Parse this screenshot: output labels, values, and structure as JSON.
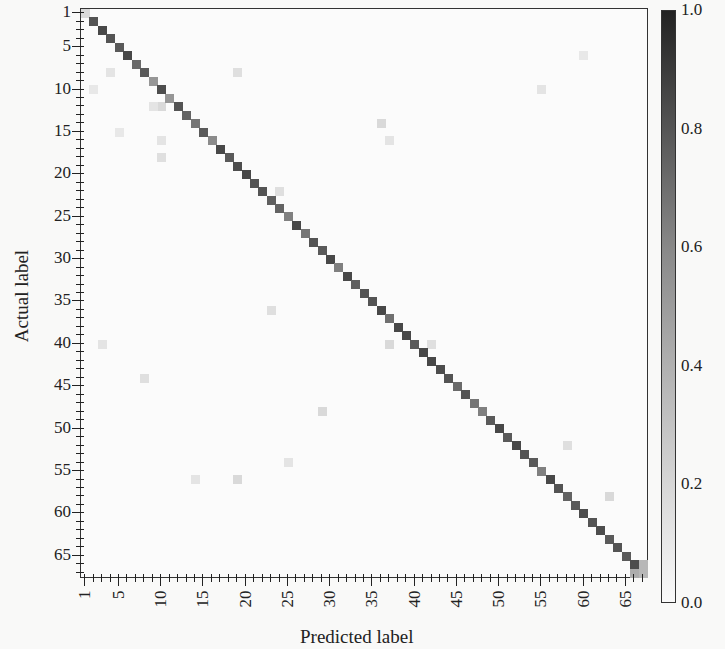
{
  "chart_data": {
    "type": "heatmap",
    "title": "",
    "xlabel": "Predicted label",
    "ylabel": "Actual label",
    "n_classes": 67,
    "x_tick_labels": [
      "1",
      "5",
      "10",
      "15",
      "20",
      "25",
      "30",
      "35",
      "40",
      "45",
      "50",
      "55",
      "60",
      "65"
    ],
    "y_tick_labels": [
      "1",
      "5",
      "10",
      "15",
      "20",
      "25",
      "30",
      "35",
      "40",
      "45",
      "50",
      "55",
      "60",
      "65"
    ],
    "tick_positions": [
      1,
      5,
      10,
      15,
      20,
      25,
      30,
      35,
      40,
      45,
      50,
      55,
      60,
      65
    ],
    "colorbar": {
      "min": 0.0,
      "max": 1.0,
      "ticks": [
        "0.0",
        "0.2",
        "0.4",
        "0.6",
        "0.8",
        "1.0"
      ],
      "colormap": "Greys"
    },
    "diagonal": [
      0.15,
      0.75,
      0.8,
      0.75,
      0.72,
      0.8,
      0.65,
      0.72,
      0.45,
      0.78,
      0.45,
      0.75,
      0.68,
      0.6,
      0.72,
      0.5,
      0.8,
      0.72,
      0.78,
      0.8,
      0.75,
      0.75,
      0.7,
      0.68,
      0.55,
      0.8,
      0.6,
      0.75,
      0.72,
      0.8,
      0.55,
      0.8,
      0.7,
      0.75,
      0.75,
      0.8,
      0.62,
      0.8,
      0.8,
      0.72,
      0.8,
      0.8,
      0.78,
      0.75,
      0.65,
      0.75,
      0.6,
      0.55,
      0.72,
      0.8,
      0.72,
      0.8,
      0.75,
      0.72,
      0.55,
      0.8,
      0.75,
      0.68,
      0.72,
      0.78,
      0.75,
      0.78,
      0.72,
      0.75,
      0.72,
      0.78,
      0.3
    ],
    "off_diagonal": [
      {
        "row": 8,
        "col": 4,
        "value": 0.1
      },
      {
        "row": 8,
        "col": 19,
        "value": 0.12
      },
      {
        "row": 10,
        "col": 2,
        "value": 0.08
      },
      {
        "row": 12,
        "col": 10,
        "value": 0.15
      },
      {
        "row": 12,
        "col": 9,
        "value": 0.1
      },
      {
        "row": 15,
        "col": 5,
        "value": 0.08
      },
      {
        "row": 16,
        "col": 10,
        "value": 0.1
      },
      {
        "row": 18,
        "col": 10,
        "value": 0.12
      },
      {
        "row": 14,
        "col": 36,
        "value": 0.15
      },
      {
        "row": 16,
        "col": 37,
        "value": 0.1
      },
      {
        "row": 22,
        "col": 24,
        "value": 0.12
      },
      {
        "row": 23,
        "col": 23,
        "value": 0.2
      },
      {
        "row": 36,
        "col": 23,
        "value": 0.12
      },
      {
        "row": 40,
        "col": 3,
        "value": 0.1
      },
      {
        "row": 40,
        "col": 37,
        "value": 0.15
      },
      {
        "row": 40,
        "col": 42,
        "value": 0.12
      },
      {
        "row": 44,
        "col": 8,
        "value": 0.12
      },
      {
        "row": 48,
        "col": 29,
        "value": 0.15
      },
      {
        "row": 54,
        "col": 25,
        "value": 0.1
      },
      {
        "row": 56,
        "col": 14,
        "value": 0.1
      },
      {
        "row": 56,
        "col": 19,
        "value": 0.15
      },
      {
        "row": 52,
        "col": 58,
        "value": 0.12
      },
      {
        "row": 58,
        "col": 63,
        "value": 0.15
      },
      {
        "row": 66,
        "col": 66,
        "value": 0.35
      },
      {
        "row": 67,
        "col": 66,
        "value": 0.35
      },
      {
        "row": 66,
        "col": 67,
        "value": 0.3
      },
      {
        "row": 10,
        "col": 55,
        "value": 0.1
      },
      {
        "row": 6,
        "col": 60,
        "value": 0.08
      }
    ],
    "background_value": 0.02
  }
}
